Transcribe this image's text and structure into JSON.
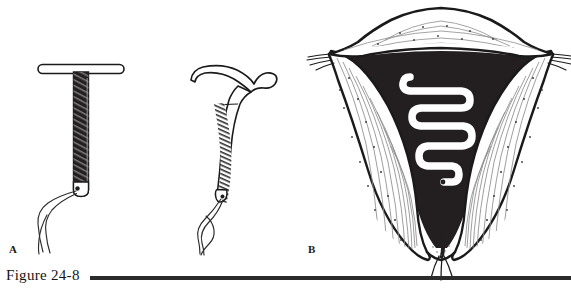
{
  "figure": {
    "number_label": "Figure 24-8",
    "panels": [
      {
        "id": "A",
        "label": "A",
        "subject": "copper-t-iud-and-curved-iud"
      },
      {
        "id": "B",
        "label": "B",
        "subject": "uterus-cross-section-with-loop-iud"
      }
    ]
  },
  "panel_a": {
    "device_1": {
      "name": "t-shaped-iud",
      "crossbar_label": "horizontal crossbar arm",
      "stem_label": "copper wound vertical stem",
      "strings_label": "retrieval strings"
    },
    "device_2": {
      "name": "curved-stem-iud",
      "crossbar_label": "curved upper arm",
      "stem_label": "coiled copper wound stem",
      "strings_label": "retrieval strings"
    }
  },
  "panel_b": {
    "anatomy": {
      "fundus_label": "uterine fundus",
      "myometrium_label": "myometrial wall",
      "cavity_label": "endometrial cavity",
      "cervix_label": "cervix",
      "tube_left_label": "left fallopian tube",
      "tube_right_label": "right fallopian tube"
    },
    "device": {
      "name": "serpentine-loop-iud",
      "label": "serpentine loop intrauterine device in situ",
      "strings_label": "retrieval strings through cervical os"
    }
  },
  "colors": {
    "ink": "#1a1a1a",
    "cavity_fill": "#231f20",
    "paper": "#ffffff",
    "rule": "#2b2b2b",
    "stipple": "#4a4a4a"
  }
}
